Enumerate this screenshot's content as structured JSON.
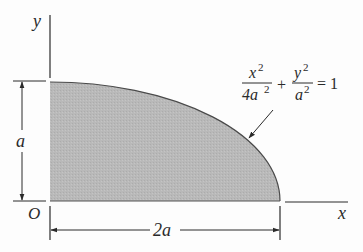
{
  "diagram": {
    "colors": {
      "fill": "#b9b9b9",
      "line": "#3a3a3a",
      "background": "#fdfdfd"
    },
    "axes": {
      "x_label": "x",
      "y_label": "y",
      "origin_label": "O"
    },
    "dimensions": {
      "height_label": "a",
      "width_label": "2a"
    },
    "equation": {
      "term1_numerator": "x",
      "term1_num_exp": "2",
      "term1_denominator": "4a",
      "term1_den_exp": "2",
      "plus": "+",
      "term2_numerator": "y",
      "term2_num_exp": "2",
      "term2_denominator": "a",
      "term2_den_exp": "2",
      "equals": "= 1"
    }
  }
}
